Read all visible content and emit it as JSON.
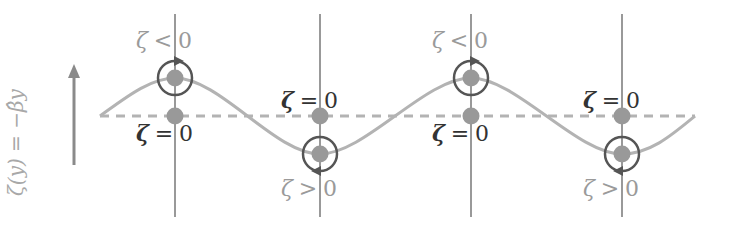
{
  "axis_label": "ζ(y) = −β̂y",
  "colors": {
    "wave": "#b3b3b3",
    "dashed": "#b3b3b3",
    "vertical_lines": "#555555",
    "dots": "#999999",
    "circles": "#555555",
    "arrow": "#8a8a8a",
    "label_dark": "#333333",
    "label_gray": "#9a9a9a"
  },
  "columns": [
    {
      "x": 175,
      "wave_position": "crest",
      "upper_label": {
        "symbol": "ζ",
        "op": "<",
        "value": "0"
      },
      "lower_label": {
        "symbol": "ζ",
        "op": "=",
        "value": "0"
      }
    },
    {
      "x": 320,
      "wave_position": "trough",
      "upper_label": {
        "symbol": "ζ",
        "op": "=",
        "value": "0"
      },
      "lower_label": {
        "symbol": "ζ",
        "op": ">",
        "value": "0"
      }
    },
    {
      "x": 471,
      "wave_position": "crest",
      "upper_label": {
        "symbol": "ζ",
        "op": "<",
        "value": "0"
      },
      "lower_label": {
        "symbol": "ζ",
        "op": "=",
        "value": "0"
      }
    },
    {
      "x": 622,
      "wave_position": "trough",
      "upper_label": {
        "symbol": "ζ",
        "op": "=",
        "value": "0"
      },
      "lower_label": {
        "symbol": "ζ",
        "op": ">",
        "value": "0"
      }
    }
  ],
  "labels": {
    "c0_top": {
      "zeta": "ζ",
      "op": "<",
      "val": "0"
    },
    "c0_bot": {
      "zeta": "ζ",
      "op": "=",
      "val": "0"
    },
    "c1_top": {
      "zeta": "ζ",
      "op": "=",
      "val": "0"
    },
    "c1_bot": {
      "zeta": "ζ",
      "op": ">",
      "val": "0"
    },
    "c2_top": {
      "zeta": "ζ",
      "op": "<",
      "val": "0"
    },
    "c2_bot": {
      "zeta": "ζ",
      "op": "=",
      "val": "0"
    },
    "c3_top": {
      "zeta": "ζ",
      "op": "=",
      "val": "0"
    },
    "c3_bot": {
      "zeta": "ζ",
      "op": ">",
      "val": "0"
    }
  }
}
